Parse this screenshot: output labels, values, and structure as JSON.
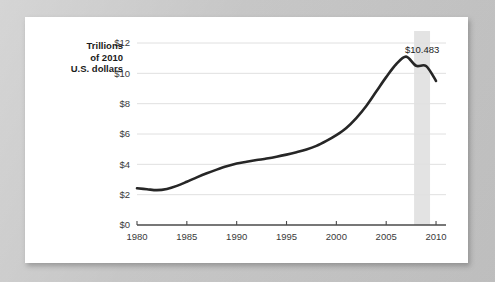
{
  "chart_data": {
    "type": "line",
    "title": "",
    "xlabel": "",
    "ylabel": "Trillions of 2010 U.S. dollars",
    "ylabel_lines": [
      "Trillions",
      "of 2010",
      "U.S. dollars"
    ],
    "xlim": [
      1980,
      2011
    ],
    "ylim": [
      0,
      12
    ],
    "grid": true,
    "legend": "none",
    "y_ticks": [
      0,
      2,
      4,
      6,
      8,
      10,
      12
    ],
    "y_tick_labels": [
      "$0",
      "$2",
      "$4",
      "$6",
      "$8",
      "$10",
      "$12"
    ],
    "x_ticks": [
      1980,
      1985,
      1990,
      1995,
      2000,
      2005,
      2010
    ],
    "x_tick_labels": [
      "1980",
      "1985",
      "1990",
      "1995",
      "2000",
      "2005",
      "2010"
    ],
    "series": [
      {
        "name": "Household debt",
        "color": "#262626",
        "x": [
          1980,
          1981,
          1982,
          1983,
          1984,
          1985,
          1986,
          1987,
          1988,
          1989,
          1990,
          1991,
          1992,
          1993,
          1994,
          1995,
          1996,
          1997,
          1998,
          1999,
          2000,
          2001,
          2002,
          2003,
          2004,
          2005,
          2006,
          2007,
          2008,
          2009,
          2010
        ],
        "values": [
          2.42,
          2.36,
          2.3,
          2.38,
          2.58,
          2.85,
          3.14,
          3.41,
          3.65,
          3.87,
          4.05,
          4.17,
          4.28,
          4.38,
          4.5,
          4.64,
          4.8,
          4.98,
          5.22,
          5.55,
          5.93,
          6.4,
          7.05,
          7.85,
          8.8,
          9.75,
          10.6,
          11.1,
          10.5,
          10.48,
          9.5
        ]
      }
    ],
    "annotations": [
      {
        "name": "peak-value-callout",
        "label": "$10.483",
        "x": 2008.6,
        "y": 11.35
      }
    ],
    "shaded_bands": [
      {
        "name": "recession-band",
        "x_start": 2007.8,
        "x_end": 2009.4,
        "color": "#e3e3e3"
      }
    ]
  }
}
